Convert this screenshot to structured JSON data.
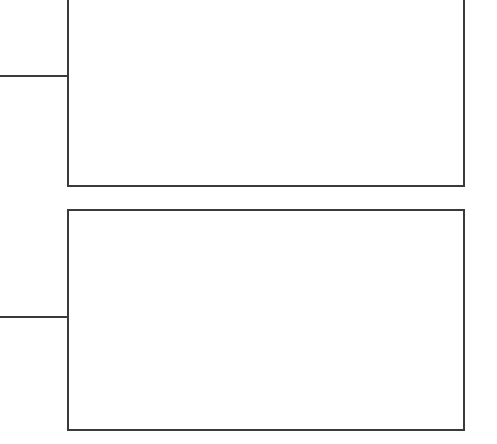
{
  "diagram": {
    "type": "tree-connector",
    "stroke_color": "#3a3a3a",
    "background": "#ffffff",
    "nodes": [
      {
        "id": "box-1",
        "label": "",
        "x": 67,
        "y": -10,
        "width": 398,
        "height": 197,
        "clipped_top": true
      },
      {
        "id": "box-2",
        "label": "",
        "x": 67,
        "y": 209,
        "width": 398,
        "height": 222,
        "clipped_top": false
      }
    ],
    "connectors": [
      {
        "id": "connector-1",
        "from_x": 0,
        "to_x": 68,
        "y": 75,
        "target": "box-1"
      },
      {
        "id": "connector-2",
        "from_x": 0,
        "to_x": 68,
        "y": 316,
        "target": "box-2"
      }
    ]
  }
}
